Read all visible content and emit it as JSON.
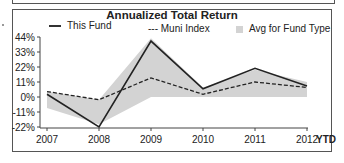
{
  "chart_data": {
    "type": "line",
    "title": "Annualized Total Return",
    "categories": [
      "2007",
      "2008",
      "2009",
      "2010",
      "2011",
      "2012"
    ],
    "x_suffix_label": "YTD",
    "series": [
      {
        "name": "This Fund",
        "style": "solid",
        "color": "#222222",
        "values": [
          2,
          -22,
          41,
          6,
          21,
          8
        ]
      },
      {
        "name": "Muni Index",
        "style": "dashed",
        "color": "#222222",
        "values": [
          4,
          -2,
          14,
          2,
          11,
          7
        ]
      },
      {
        "name": "Avg for Fund Type",
        "style": "area",
        "color": "#d3d3d3",
        "upper": [
          4,
          -2,
          43,
          7,
          20,
          11
        ],
        "lower": [
          -8,
          -20,
          0,
          0,
          0,
          0
        ]
      }
    ],
    "y_ticks": [
      "44%",
      "33%",
      "22%",
      "11%",
      "0%",
      "-11%",
      "-22%"
    ],
    "ylim": [
      -22,
      44
    ],
    "xlabel": "",
    "ylabel": "",
    "grid": false,
    "legend_position": "top"
  },
  "legend": {
    "fund": "This Fund",
    "index": "--- Muni Index",
    "avg": "Avg for Fund Type"
  }
}
